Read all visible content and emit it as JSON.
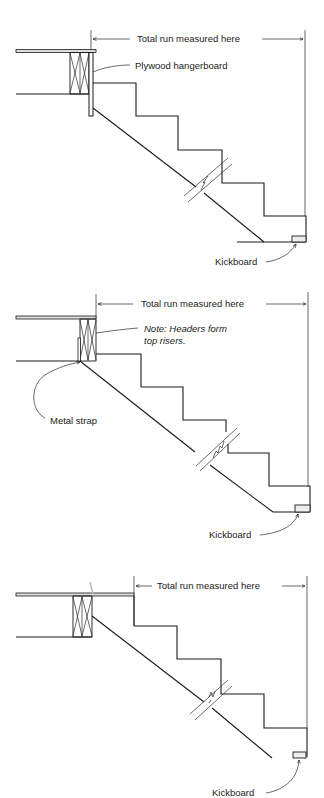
{
  "figures": [
    {
      "id": "stair-1",
      "dimension_label": "Total run measured here",
      "callouts": [
        {
          "label": "Plywood hangerboard"
        },
        {
          "label": "Kickboard"
        }
      ]
    },
    {
      "id": "stair-2",
      "dimension_label": "Total run measured here",
      "note_line1": "Note: Headers form",
      "note_line2": "top risers.",
      "callouts": [
        {
          "label": "Metal strap"
        },
        {
          "label": "Kickboard"
        }
      ]
    },
    {
      "id": "stair-3",
      "dimension_label": "Total run measured here",
      "callouts": [
        {
          "label": "Kickboard"
        }
      ]
    }
  ],
  "colors": {
    "line": "#1a1a1a",
    "background": "#ffffff"
  }
}
